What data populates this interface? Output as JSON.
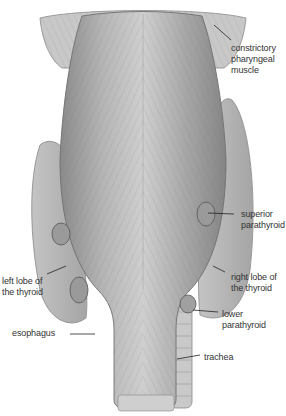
{
  "figure": {
    "colors": {
      "background": "#ffffff",
      "tissue": "#b8b8b8",
      "tissue_dark": "#7a7a7a",
      "label": "#333333",
      "leader": "#222222"
    }
  },
  "labels": {
    "constrictory": "constrictory\npharyngeal\nmuscle",
    "superior_parathyroid": "superior\nparathyroid",
    "left_lobe": "left lobe of\nthe thyroid",
    "right_lobe": "right lobe of\nthe thyroid",
    "lower_parathyroid": "lower\nparathyroid",
    "esophagus": "esophagus",
    "trachea": "trachea"
  }
}
